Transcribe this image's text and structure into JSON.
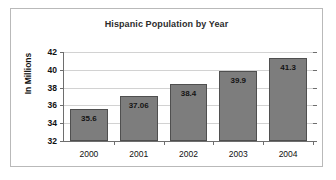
{
  "chart_data": {
    "type": "bar",
    "title": "Hispanic Population by Year",
    "xlabel": "",
    "ylabel": "In Millions",
    "categories": [
      "2000",
      "2001",
      "2002",
      "2003",
      "2004"
    ],
    "values": [
      35.6,
      37.06,
      38.4,
      39.9,
      41.3
    ],
    "value_labels": [
      "35.6",
      "37.06",
      "38.4",
      "39.9",
      "41.3"
    ],
    "ylim": [
      32,
      42
    ],
    "yticks": [
      32,
      34,
      36,
      38,
      40,
      42
    ],
    "ytick_labels": [
      "32",
      "34",
      "36",
      "38",
      "40",
      "42"
    ],
    "grid": true,
    "legend": null,
    "legend_position": "none",
    "bar_color": "#7d7d7d",
    "bar_border_color": "#4f4f4f",
    "gridline_color": "#d2d2d2",
    "axis_color": "#6e6e6e",
    "text_color": "#111111",
    "title_color": "#2c2c2c",
    "background_color": "#ffffff",
    "frame_color": "#b9b9b9"
  }
}
